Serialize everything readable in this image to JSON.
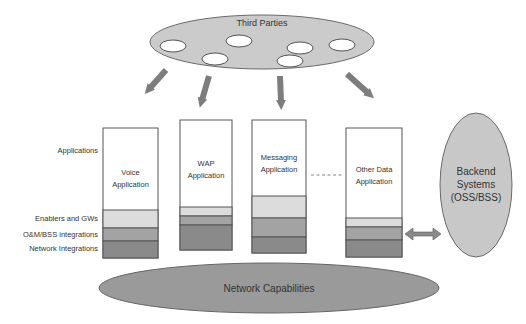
{
  "third_parties": {
    "label": "Third Parties",
    "fill": "#c8c8c8",
    "members": [
      {
        "cx": 173,
        "cy": 46
      },
      {
        "cx": 239,
        "cy": 41
      },
      {
        "cx": 300,
        "cy": 48
      },
      {
        "cx": 342,
        "cy": 45
      },
      {
        "cx": 215,
        "cy": 59
      },
      {
        "cx": 290,
        "cy": 61
      }
    ]
  },
  "layer_labels": {
    "applications": "Applications",
    "enablers": "Enablers and GWs",
    "om_bss": "O&M/BSS integrations",
    "network": "Network Integrations"
  },
  "columns": [
    {
      "id": "voice",
      "line1": "Voice",
      "line2": "Application"
    },
    {
      "id": "wap",
      "line1": "WAP",
      "line2": "Application"
    },
    {
      "id": "messaging",
      "line1": "Messaging",
      "line2": "Application"
    },
    {
      "id": "other-data",
      "line1": "Other Data",
      "line2": "Application"
    }
  ],
  "backend": {
    "line1": "Backend",
    "line2": "Systems",
    "line3": "(OSS/BSS)"
  },
  "network_capabilities": {
    "label": "Network Capabilities"
  },
  "colors": {
    "enablers": "#dcdcdc",
    "om_bss": "#a3a3a3",
    "network": "#8a8a8a",
    "arrow": "#7d7d7d",
    "ellipse_dark": "#9a9a9a",
    "ellipse_light": "#cfcfcf"
  }
}
